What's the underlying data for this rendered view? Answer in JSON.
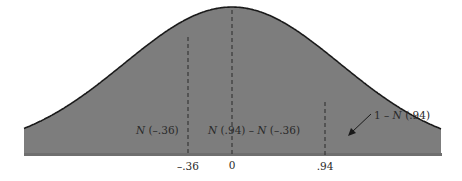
{
  "chart_data": {
    "type": "area",
    "title": "",
    "xlabel": "",
    "ylabel": "",
    "distribution": "standard normal",
    "x_ticks": [
      {
        "value": -0.36,
        "label": "-.36"
      },
      {
        "value": 0,
        "label": "0"
      },
      {
        "value": 0.94,
        "label": ".94"
      }
    ],
    "regions": [
      {
        "name": "left-tail",
        "from": null,
        "to": -0.36,
        "label_prefix": "N",
        "label": "(–.36)"
      },
      {
        "name": "middle",
        "from": -0.36,
        "to": 0.94,
        "label": "N (.94) – N (–.36)"
      },
      {
        "name": "right-tail",
        "from": 0.94,
        "to": null,
        "label": "1 – N (.94)",
        "arrow": true
      }
    ],
    "dashed_lines_at": [
      -0.36,
      0,
      0.94
    ],
    "grid": false,
    "legend": null,
    "colors": {
      "fill": "#7d7d7d",
      "curve": "#1a1a1a",
      "dash": "#2b2b2b"
    }
  },
  "labels": {
    "left_region_N": "N",
    "left_region_arg": " (–.36)",
    "middle_N1": "N",
    "middle_arg1": " (.94) – ",
    "middle_N2": "N",
    "middle_arg2": " (–.36)",
    "right_prefix": "1 – ",
    "right_N": "N",
    "right_arg": " (.94)",
    "tick_neg036": "–.36",
    "tick_zero": "0",
    "tick_094": ".94"
  }
}
